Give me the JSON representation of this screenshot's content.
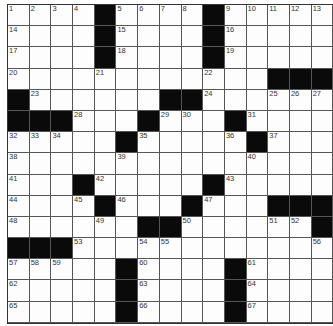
{
  "puzzle": {
    "rows": 15,
    "cols": 15,
    "colors": {
      "block": "#0a0a0a",
      "cell": "#fdfdfd",
      "line": "#555555"
    },
    "grid": [
      [
        "1",
        "2",
        "3",
        "4",
        "#",
        "5",
        "6",
        "7",
        "8",
        "#",
        "9",
        "10",
        "11",
        "12",
        "13"
      ],
      [
        "14",
        ".",
        ".",
        ".",
        "#",
        "15",
        ".",
        ".",
        ".",
        "#",
        "16",
        ".",
        ".",
        ".",
        "."
      ],
      [
        "17",
        ".",
        ".",
        ".",
        "#",
        "18",
        ".",
        ".",
        ".",
        "#",
        "19",
        ".",
        ".",
        ".",
        "."
      ],
      [
        "20",
        ".",
        ".",
        ".",
        "21",
        ".",
        ".",
        ".",
        ".",
        "22",
        ".",
        ".",
        "#",
        "#",
        "#"
      ],
      [
        "#",
        "23",
        ".",
        ".",
        ".",
        ".",
        ".",
        "#",
        "#",
        "24",
        ".",
        ".",
        "25",
        "26",
        "27"
      ],
      [
        "#",
        "#",
        "#",
        "28",
        ".",
        ".",
        "#",
        "29",
        "30",
        ".",
        "#",
        "31",
        ".",
        ".",
        "."
      ],
      [
        "32",
        "33",
        "34",
        ".",
        ".",
        "#",
        "35",
        ".",
        ".",
        ".",
        "36",
        "#",
        "37",
        ".",
        "."
      ],
      [
        "38",
        ".",
        ".",
        ".",
        ".",
        "39",
        ".",
        ".",
        ".",
        ".",
        ".",
        "40",
        ".",
        ".",
        "."
      ],
      [
        "41",
        ".",
        ".",
        "#",
        "42",
        ".",
        ".",
        ".",
        ".",
        "#",
        "43",
        ".",
        ".",
        ".",
        "."
      ],
      [
        "44",
        ".",
        ".",
        "45",
        "#",
        "46",
        ".",
        ".",
        "#",
        "47",
        ".",
        ".",
        "#",
        "#",
        "#"
      ],
      [
        "48",
        ".",
        ".",
        ".",
        "49",
        ".",
        "#",
        "#",
        "50",
        ".",
        ".",
        ".",
        "51",
        "52",
        "#"
      ],
      [
        "#",
        "#",
        "#",
        "53",
        ".",
        ".",
        "54",
        "55",
        ".",
        ".",
        ".",
        ".",
        ".",
        ".",
        "56"
      ],
      [
        "57",
        "58",
        "59",
        ".",
        ".",
        "#",
        "60",
        ".",
        ".",
        ".",
        "#",
        "61",
        ".",
        ".",
        "."
      ],
      [
        "62",
        ".",
        ".",
        ".",
        ".",
        "#",
        "63",
        ".",
        ".",
        ".",
        "#",
        "64",
        ".",
        ".",
        "."
      ],
      [
        "65",
        ".",
        ".",
        ".",
        ".",
        "#",
        "66",
        ".",
        ".",
        ".",
        "#",
        "67",
        ".",
        ".",
        "."
      ]
    ]
  }
}
